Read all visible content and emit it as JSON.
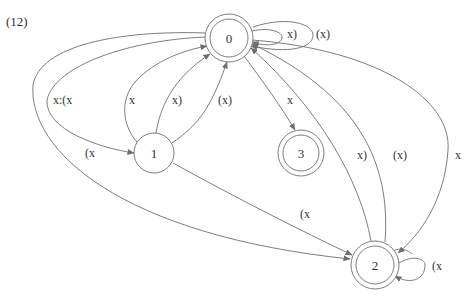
{
  "figure_label": "(12)",
  "nodes": [
    {
      "id": "0",
      "label": "0",
      "accepting": true
    },
    {
      "id": "1",
      "label": "1",
      "accepting": false
    },
    {
      "id": "2",
      "label": "2",
      "accepting": true
    },
    {
      "id": "3",
      "label": "3",
      "accepting": true
    }
  ],
  "edges": [
    {
      "from": "0",
      "to": "0",
      "label": "x)"
    },
    {
      "from": "0",
      "to": "0",
      "label": "(x)"
    },
    {
      "from": "0",
      "to": "1",
      "label": "x:(x"
    },
    {
      "from": "0",
      "to": "1",
      "label": "(x"
    },
    {
      "from": "1",
      "to": "0",
      "label": "x"
    },
    {
      "from": "1",
      "to": "0",
      "label": "x)"
    },
    {
      "from": "1",
      "to": "0",
      "label": "(x)"
    },
    {
      "from": "0",
      "to": "3",
      "label": "x"
    },
    {
      "from": "2",
      "to": "0",
      "label": "x)"
    },
    {
      "from": "2",
      "to": "0",
      "label": "(x)"
    },
    {
      "from": "0",
      "to": "2",
      "label": "x"
    },
    {
      "from": "1",
      "to": "2",
      "label": "(x"
    },
    {
      "from": "0",
      "to": "2",
      "label": ""
    },
    {
      "from": "2",
      "to": "2",
      "label": "(x"
    }
  ]
}
